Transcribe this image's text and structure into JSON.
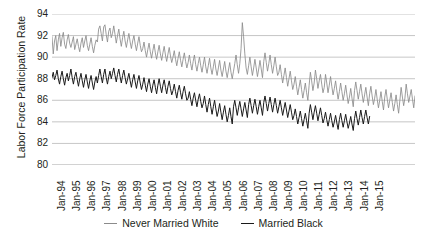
{
  "chart_data": {
    "type": "line",
    "title": "",
    "xlabel": "",
    "ylabel": "Labor Force Participation Rate",
    "ylim": [
      80,
      94
    ],
    "y_ticks": [
      94,
      92,
      90,
      88,
      86,
      84,
      82,
      80
    ],
    "grid": "horizontal",
    "legend_position": "bottom-center",
    "x_tick_labels": [
      "Jan-94",
      "Jan-95",
      "Jan-96",
      "Jan-97",
      "Jan-98",
      "Jan-99",
      "Jan-00",
      "Jan-01",
      "Jan-02",
      "Jan-03",
      "Jan-04",
      "Jan-05",
      "Jan-06",
      "Jan-07",
      "Jan-08",
      "Jan-09",
      "Jan-10",
      "Jan-11",
      "Jan-12",
      "Jan-13",
      "Jan-14",
      "Jan-15"
    ],
    "x_start": "Jan-94",
    "x_end": "Jan-15",
    "x_frequency": "monthly",
    "series": [
      {
        "name": "Never Married White",
        "color": "#8b8b8b",
        "values": [
          91.9,
          90.3,
          91.5,
          92.0,
          90.6,
          91.6,
          92.2,
          91.0,
          91.8,
          92.3,
          91.2,
          90.8,
          91.6,
          92.1,
          91.3,
          90.9,
          91.4,
          91.9,
          90.7,
          91.2,
          91.7,
          91.0,
          90.5,
          91.3,
          91.8,
          90.9,
          91.5,
          92.0,
          91.1,
          90.6,
          91.2,
          91.8,
          91.0,
          90.4,
          91.1,
          91.6,
          91.4,
          92.6,
          92.9,
          92.2,
          91.5,
          92.8,
          93.0,
          92.1,
          91.4,
          92.4,
          92.7,
          91.8,
          92.2,
          92.9,
          92.1,
          91.3,
          92.0,
          92.6,
          91.7,
          91.0,
          91.8,
          92.4,
          91.5,
          90.9,
          91.6,
          92.2,
          91.4,
          90.8,
          91.5,
          92.0,
          91.2,
          90.6,
          91.3,
          91.9,
          91.1,
          90.5,
          90.8,
          91.4,
          90.6,
          90.0,
          90.7,
          91.3,
          90.5,
          89.9,
          90.6,
          91.2,
          90.4,
          89.8,
          90.5,
          91.1,
          90.3,
          89.7,
          90.4,
          91.0,
          90.2,
          89.6,
          90.3,
          90.9,
          90.1,
          89.5,
          90.0,
          90.6,
          89.8,
          89.2,
          89.9,
          90.5,
          89.7,
          89.1,
          89.8,
          90.4,
          89.6,
          89.0,
          89.5,
          90.2,
          89.4,
          88.8,
          89.6,
          90.2,
          89.3,
          88.7,
          89.4,
          90.0,
          89.2,
          88.6,
          89.3,
          90.0,
          89.1,
          88.5,
          89.2,
          89.9,
          89.0,
          88.4,
          89.1,
          89.8,
          88.9,
          88.3,
          89.0,
          89.7,
          88.8,
          88.2,
          88.9,
          89.6,
          88.7,
          88.1,
          88.8,
          89.5,
          88.6,
          88.0,
          88.7,
          89.4,
          90.2,
          89.3,
          88.5,
          89.4,
          90.8,
          93.2,
          91.9,
          90.3,
          89.0,
          88.4,
          89.2,
          90.0,
          89.1,
          88.3,
          89.0,
          89.8,
          89.0,
          88.2,
          88.9,
          89.7,
          88.9,
          88.1,
          89.6,
          90.4,
          89.5,
          88.7,
          89.4,
          90.2,
          89.3,
          88.5,
          89.2,
          90.0,
          89.1,
          88.3,
          88.6,
          89.3,
          88.4,
          87.6,
          88.3,
          89.0,
          88.1,
          87.3,
          88.0,
          88.7,
          87.8,
          87.0,
          87.5,
          88.2,
          87.3,
          86.5,
          87.2,
          87.9,
          87.0,
          86.2,
          86.9,
          87.6,
          86.7,
          86.0,
          87.4,
          88.6,
          87.8,
          86.9,
          87.6,
          88.8,
          88.0,
          87.1,
          87.8,
          88.4,
          87.5,
          86.7,
          87.2,
          88.4,
          87.6,
          86.7,
          87.4,
          88.2,
          87.3,
          86.5,
          87.1,
          87.8,
          86.9,
          86.1,
          86.8,
          87.6,
          86.8,
          86.0,
          86.6,
          87.4,
          86.5,
          85.7,
          86.3,
          87.1,
          86.2,
          85.4,
          86.9,
          87.7,
          86.9,
          86.1,
          86.8,
          87.5,
          86.6,
          85.8,
          86.5,
          87.2,
          86.3,
          85.5,
          86.6,
          87.3,
          86.4,
          85.6,
          86.2,
          87.0,
          86.1,
          85.3,
          86.0,
          86.8,
          85.9,
          85.1,
          86.3,
          87.0,
          86.1,
          85.3,
          86.0,
          86.7,
          85.8,
          85.0,
          85.7,
          86.5,
          85.6,
          84.8,
          86.0,
          87.2,
          86.3,
          85.5,
          86.2,
          87.5,
          86.6,
          85.8,
          86.4,
          87.0,
          86.1,
          85.3,
          86.4
        ]
      },
      {
        "name": "Married Black",
        "color": "#1a1a1a",
        "values": [
          88.1,
          88.6,
          87.9,
          88.3,
          88.8,
          88.0,
          87.5,
          88.2,
          88.7,
          88.0,
          87.4,
          88.1,
          88.5,
          87.8,
          88.3,
          88.9,
          88.1,
          87.5,
          88.2,
          88.6,
          87.9,
          87.3,
          88.0,
          88.5,
          87.8,
          87.2,
          87.9,
          88.4,
          87.7,
          87.1,
          87.8,
          88.3,
          87.6,
          87.0,
          87.7,
          88.2,
          87.6,
          88.3,
          88.9,
          88.2,
          87.6,
          88.4,
          88.9,
          88.1,
          87.5,
          88.2,
          88.7,
          88.0,
          88.5,
          89.0,
          88.3,
          87.7,
          88.4,
          88.9,
          88.2,
          87.6,
          88.3,
          88.8,
          88.1,
          87.5,
          88.0,
          88.5,
          87.8,
          87.2,
          87.9,
          88.4,
          87.7,
          87.1,
          87.8,
          88.3,
          87.6,
          87.0,
          87.5,
          88.1,
          87.4,
          86.8,
          87.5,
          88.0,
          87.3,
          86.7,
          87.4,
          87.9,
          87.2,
          86.6,
          87.4,
          88.0,
          87.3,
          86.7,
          87.4,
          87.9,
          87.2,
          86.6,
          87.3,
          87.8,
          87.1,
          86.5,
          86.9,
          87.5,
          86.8,
          86.2,
          86.9,
          87.4,
          86.7,
          86.1,
          86.8,
          87.3,
          86.6,
          86.0,
          86.2,
          86.8,
          86.1,
          85.5,
          86.2,
          86.7,
          86.0,
          85.4,
          86.1,
          86.6,
          85.9,
          85.3,
          85.7,
          86.4,
          85.6,
          84.9,
          85.6,
          86.2,
          85.4,
          84.7,
          85.4,
          86.0,
          85.2,
          84.5,
          85.0,
          85.7,
          84.9,
          84.2,
          84.9,
          85.5,
          84.7,
          84.0,
          84.6,
          85.3,
          84.5,
          83.8,
          85.4,
          86.0,
          85.3,
          84.6,
          85.3,
          85.9,
          85.2,
          84.5,
          85.2,
          85.8,
          85.1,
          84.4,
          85.6,
          86.2,
          85.5,
          84.8,
          85.5,
          86.1,
          85.4,
          84.7,
          85.4,
          86.0,
          85.3,
          84.6,
          85.8,
          86.4,
          85.7,
          85.0,
          85.7,
          86.3,
          85.6,
          84.9,
          85.6,
          86.2,
          85.5,
          84.8,
          85.4,
          86.0,
          85.3,
          84.6,
          85.2,
          85.8,
          85.1,
          84.4,
          85.0,
          85.6,
          84.9,
          84.2,
          84.6,
          85.2,
          84.5,
          83.8,
          84.4,
          85.0,
          84.3,
          83.6,
          84.2,
          84.8,
          84.1,
          83.4,
          84.8,
          85.6,
          84.9,
          84.2,
          84.9,
          85.5,
          84.8,
          84.1,
          84.7,
          85.3,
          84.6,
          83.9,
          84.3,
          84.9,
          84.2,
          83.6,
          84.2,
          84.8,
          84.1,
          83.5,
          84.0,
          84.6,
          83.9,
          83.3,
          84.2,
          84.8,
          84.1,
          83.5,
          84.1,
          84.7,
          84.0,
          83.4,
          83.9,
          84.5,
          83.8,
          83.2,
          84.3,
          85.0,
          84.3,
          83.7,
          84.4,
          85.1,
          84.4,
          83.8,
          84.5,
          85.1,
          84.4,
          83.8,
          84.5
        ]
      }
    ]
  },
  "legend": {
    "entries": [
      {
        "label": "Never Married White"
      },
      {
        "label": "Married Black"
      }
    ]
  },
  "axis": {
    "y_title": "Labor Force Participation Rate"
  }
}
